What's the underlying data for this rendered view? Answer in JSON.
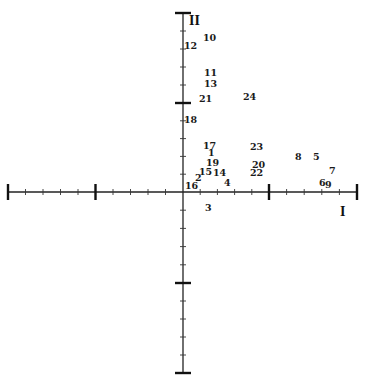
{
  "chart_data": {
    "type": "scatter",
    "title": "",
    "xlabel": "I",
    "ylabel": "II",
    "xlim": [
      -2,
      2
    ],
    "ylim": [
      -2,
      2
    ],
    "grid": false,
    "legend": null,
    "axes_style": "cross axes through origin, major ticks at ±1 and ±2, 4 minor ticks between",
    "points": [
      {
        "label": "1",
        "x": 0.3,
        "y": 0.4
      },
      {
        "label": "2",
        "x": 0.15,
        "y": 0.13
      },
      {
        "label": "3",
        "x": 0.27,
        "y": -0.2
      },
      {
        "label": "4",
        "x": 0.47,
        "y": 0.08
      },
      {
        "label": "5",
        "x": 1.52,
        "y": 0.38
      },
      {
        "label": "6",
        "x": 1.62,
        "y": 0.08
      },
      {
        "label": "7",
        "x": 1.72,
        "y": 0.22
      },
      {
        "label": "8",
        "x": 1.31,
        "y": 0.38
      },
      {
        "label": "9",
        "x": 1.68,
        "y": 0.06
      },
      {
        "label": "10",
        "x": 0.28,
        "y": 1.7
      },
      {
        "label": "11",
        "x": 0.3,
        "y": 1.31
      },
      {
        "label": "12",
        "x": 0.08,
        "y": 1.6
      },
      {
        "label": "13",
        "x": 0.3,
        "y": 1.19
      },
      {
        "label": "14",
        "x": 0.4,
        "y": 0.21
      },
      {
        "label": "15",
        "x": 0.25,
        "y": 0.21
      },
      {
        "label": "16",
        "x": 0.08,
        "y": 0.06
      },
      {
        "label": "17",
        "x": 0.27,
        "y": 0.48
      },
      {
        "label": "18",
        "x": 0.08,
        "y": 0.78
      },
      {
        "label": "19",
        "x": 0.3,
        "y": 0.3
      },
      {
        "label": "20",
        "x": 0.86,
        "y": 0.28
      },
      {
        "label": "21",
        "x": 0.25,
        "y": 1.02
      },
      {
        "label": "22",
        "x": 0.84,
        "y": 0.19
      },
      {
        "label": "23",
        "x": 0.84,
        "y": 0.47
      },
      {
        "label": "24",
        "x": 0.74,
        "y": 1.04
      }
    ]
  },
  "axes": {
    "x_label": "I",
    "y_label": "II"
  },
  "labels": [
    {
      "text": "10",
      "px": 203,
      "py": 41
    },
    {
      "text": "12",
      "px": 184,
      "py": 49
    },
    {
      "text": "11",
      "px": 204,
      "py": 76
    },
    {
      "text": "13",
      "px": 204,
      "py": 87
    },
    {
      "text": "21",
      "px": 199,
      "py": 102
    },
    {
      "text": "24",
      "px": 243,
      "py": 100
    },
    {
      "text": "18",
      "px": 184,
      "py": 123
    },
    {
      "text": "17",
      "px": 203,
      "py": 149
    },
    {
      "text": "1",
      "px": 208,
      "py": 156
    },
    {
      "text": "23",
      "px": 250,
      "py": 150
    },
    {
      "text": "19",
      "px": 206,
      "py": 166
    },
    {
      "text": "20",
      "px": 252,
      "py": 168
    },
    {
      "text": "15",
      "px": 199,
      "py": 175
    },
    {
      "text": "14",
      "px": 213,
      "py": 176
    },
    {
      "text": "22",
      "px": 250,
      "py": 176
    },
    {
      "text": "2",
      "px": 195,
      "py": 181
    },
    {
      "text": "16",
      "px": 185,
      "py": 189
    },
    {
      "text": "4",
      "px": 224,
      "py": 186
    },
    {
      "text": "3",
      "px": 205,
      "py": 211
    },
    {
      "text": "8",
      "px": 295,
      "py": 160
    },
    {
      "text": "5",
      "px": 313,
      "py": 160
    },
    {
      "text": "7",
      "px": 329,
      "py": 174
    },
    {
      "text": "6",
      "px": 319,
      "py": 186
    },
    {
      "text": "9",
      "px": 325,
      "py": 188
    }
  ]
}
